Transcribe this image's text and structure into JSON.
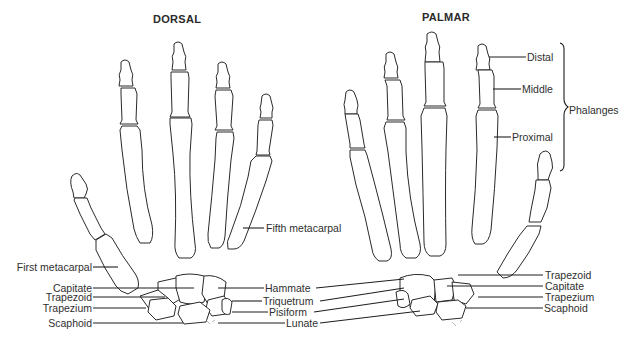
{
  "diagram": {
    "views": [
      {
        "id": "dorsal",
        "title": "DORSAL"
      },
      {
        "id": "palmar",
        "title": "PALMAR"
      }
    ],
    "dorsal_labels": {
      "fifth_metacarpal": "Fifth metacarpal",
      "first_metacarpal": "First metacarpal",
      "capitate": "Capitate",
      "trapezoid": "Trapezoid",
      "trapezium": "Trapezium",
      "scaphoid": "Scaphoid"
    },
    "shared_labels": {
      "hammate": "Hammate",
      "triquetrum": "Triquetrum",
      "pisiform": "Pisiform",
      "lunate": "Lunate"
    },
    "palmar_labels": {
      "distal": "Distal",
      "middle": "Middle",
      "proximal": "Proximal",
      "phalanges": "Phalanges",
      "trapezoid": "Trapezoid",
      "capitate": "Capitate",
      "trapezium": "Trapezium",
      "scaphoid": "Scaphoid"
    },
    "artist_signature": "G.H."
  }
}
